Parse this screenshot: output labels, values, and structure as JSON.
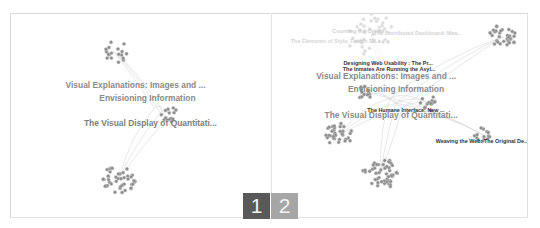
{
  "figure": {
    "panels": [
      {
        "id": "1",
        "badge_label": "1",
        "badge_color": "#595959",
        "labels": [
          {
            "text": "Visual Explanations: Images and ...",
            "x": 125,
            "y": 75,
            "size": 8.5,
            "color": "#8a8a8a",
            "opacity": 1
          },
          {
            "text": "Envisioning Information",
            "x": 137,
            "y": 88,
            "size": 8.5,
            "color": "#8a8a8a",
            "opacity": 1
          },
          {
            "text": "The Visual Display of Quantitati...",
            "x": 140,
            "y": 113,
            "size": 8.5,
            "color": "#7d7d7d",
            "opacity": 1
          }
        ],
        "clusters": [
          {
            "name": "top-fan-cluster",
            "cx": 103,
            "cy": 38,
            "r": 14,
            "n": 18
          },
          {
            "name": "middle-right-cluster",
            "cx": 160,
            "cy": 102,
            "r": 9,
            "n": 14
          },
          {
            "name": "bottom-cluster",
            "cx": 108,
            "cy": 166,
            "r": 17,
            "n": 42
          }
        ]
      },
      {
        "id": "2",
        "badge_label": "2",
        "badge_color": "#a6a6a6",
        "labels": [
          {
            "text": "Counting the Online ...",
            "x": 90,
            "y": 19,
            "size": 5.5,
            "color": "#c8c8c8",
            "opacity": 0.8
          },
          {
            "text": "The Distributed Dashboard: Mea...",
            "x": 147,
            "y": 21,
            "size": 5.5,
            "color": "#c8c8c8",
            "opacity": 0.8
          },
          {
            "text": "The Elements of Style, Fourth Ed...",
            "x": 64,
            "y": 29,
            "size": 5.5,
            "color": "#cccccc",
            "opacity": 0.8
          },
          {
            "text": "Designing Web Usability : The Pr...",
            "x": 117,
            "y": 52,
            "size": 5.5,
            "color": "#333333",
            "opacity": 1
          },
          {
            "text": "The Inmates Are Running the Asyl...",
            "x": 118,
            "y": 58,
            "size": 5.5,
            "color": "#333333",
            "opacity": 1
          },
          {
            "text": "Visual Explanations: Images and ...",
            "x": 115,
            "y": 66,
            "size": 8.5,
            "color": "#8a8a8a",
            "opacity": 1
          },
          {
            "text": "Envisioning Information",
            "x": 125,
            "y": 79,
            "size": 8.5,
            "color": "#8a8a8a",
            "opacity": 1
          },
          {
            "text": "The Humane Interface: New ...",
            "x": 135,
            "y": 99,
            "size": 5.5,
            "color": "#333333",
            "opacity": 1
          },
          {
            "text": "The Visual Display of Quantitati...",
            "x": 120,
            "y": 105,
            "size": 8.5,
            "color": "#8a8a8a",
            "opacity": 1
          },
          {
            "text": "Weaving the Web: The Original De...",
            "x": 212,
            "y": 130,
            "size": 5.5,
            "color": "#333333",
            "opacity": 1
          }
        ],
        "clusters": [
          {
            "name": "faded-top-cluster",
            "cx": 100,
            "cy": 22,
            "r": 26,
            "n": 40,
            "faded": true
          },
          {
            "name": "top-right-cluster",
            "cx": 233,
            "cy": 23,
            "r": 14,
            "n": 34
          },
          {
            "name": "left-small-cluster",
            "cx": 92,
            "cy": 80,
            "r": 8,
            "n": 12
          },
          {
            "name": "center-right-cluster",
            "cx": 158,
            "cy": 90,
            "r": 9,
            "n": 14
          },
          {
            "name": "left-cluster",
            "cx": 68,
            "cy": 122,
            "r": 14,
            "n": 34
          },
          {
            "name": "right-small-cluster",
            "cx": 213,
            "cy": 122,
            "r": 9,
            "n": 14
          },
          {
            "name": "bottom-cluster",
            "cx": 109,
            "cy": 161,
            "r": 18,
            "n": 48
          }
        ]
      }
    ]
  }
}
